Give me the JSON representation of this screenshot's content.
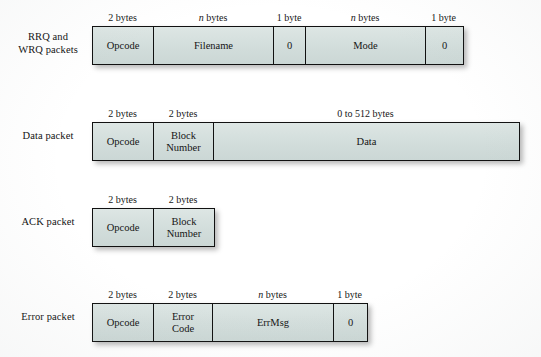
{
  "figure": {
    "box_fill_color": "#d6e0de",
    "border_color": "#111111",
    "background_color": "#ffffff"
  },
  "rows": [
    {
      "label": "RRQ and\nWRQ packets",
      "name": "rrq-wrq-packets",
      "cells": [
        {
          "caption_prefix": "2",
          "caption_italic": "",
          "caption_suffix": " bytes",
          "text": "Opcode",
          "name": "opcode"
        },
        {
          "caption_prefix": "",
          "caption_italic": "n",
          "caption_suffix": " bytes",
          "text": "Filename",
          "name": "filename"
        },
        {
          "caption_prefix": "1",
          "caption_italic": "",
          "caption_suffix": " byte",
          "text": "0",
          "name": "zero-terminator-1"
        },
        {
          "caption_prefix": "",
          "caption_italic": "n",
          "caption_suffix": " bytes",
          "text": "Mode",
          "name": "mode"
        },
        {
          "caption_prefix": "1",
          "caption_italic": "",
          "caption_suffix": " byte",
          "text": "0",
          "name": "zero-terminator-2"
        }
      ]
    },
    {
      "label": "Data packet",
      "name": "data-packet",
      "cells": [
        {
          "caption_prefix": "2",
          "caption_italic": "",
          "caption_suffix": " bytes",
          "text": "Opcode",
          "name": "opcode"
        },
        {
          "caption_prefix": "2",
          "caption_italic": "",
          "caption_suffix": " bytes",
          "text": "Block\nNumber",
          "name": "block-number"
        },
        {
          "caption_prefix": "0 to 512",
          "caption_italic": "",
          "caption_suffix": " bytes",
          "text": "Data",
          "name": "data"
        }
      ]
    },
    {
      "label": "ACK packet",
      "name": "ack-packet",
      "cells": [
        {
          "caption_prefix": "2",
          "caption_italic": "",
          "caption_suffix": " bytes",
          "text": "Opcode",
          "name": "opcode"
        },
        {
          "caption_prefix": "2",
          "caption_italic": "",
          "caption_suffix": " bytes",
          "text": "Block\nNumber",
          "name": "block-number"
        }
      ]
    },
    {
      "label": "Error packet",
      "name": "error-packet",
      "cells": [
        {
          "caption_prefix": "2",
          "caption_italic": "",
          "caption_suffix": " bytes",
          "text": "Opcode",
          "name": "opcode"
        },
        {
          "caption_prefix": "2",
          "caption_italic": "",
          "caption_suffix": " bytes",
          "text": "Error\nCode",
          "name": "error-code"
        },
        {
          "caption_prefix": "",
          "caption_italic": "n",
          "caption_suffix": " bytes",
          "text": "ErrMsg",
          "name": "errmsg"
        },
        {
          "caption_prefix": "1",
          "caption_italic": "",
          "caption_suffix": " byte",
          "text": "0",
          "name": "zero-terminator"
        }
      ]
    }
  ],
  "layout": {
    "row_tops": [
      26,
      122,
      208,
      303
    ],
    "label_tops": [
      30,
      129,
      215,
      310
    ],
    "cell_widths": [
      [
        61,
        120,
        32,
        120,
        37
      ],
      [
        61,
        60,
        305
      ],
      [
        61,
        60
      ],
      [
        61,
        59,
        121,
        33
      ]
    ]
  }
}
